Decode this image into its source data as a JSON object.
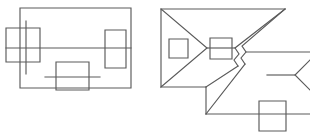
{
  "image": {
    "kind": "line-drawing",
    "description": "Two black-and-white geometric wireframe line drawings on a white background",
    "width": 310,
    "height": 133,
    "background_color": "#ffffff",
    "stroke_color": "#5a5a5a",
    "stroke_width": 1.15,
    "figure_count": 2
  },
  "figures": [
    {
      "id": "figure-left",
      "name": "rectangle-with-three-squares",
      "origin": {
        "x": 0,
        "y": 0
      },
      "shapes": [
        {
          "name": "outer-rectangle",
          "type": "polyline",
          "closed": true,
          "points": [
            [
              20,
              8
            ],
            [
              131,
              8
            ],
            [
              131,
              88
            ],
            [
              20,
              88
            ]
          ]
        },
        {
          "name": "horizontal-midline",
          "type": "polyline",
          "closed": false,
          "points": [
            [
              6,
              48
            ],
            [
              131,
              48
            ]
          ]
        },
        {
          "name": "left-vertical-line",
          "type": "polyline",
          "closed": false,
          "points": [
            [
              26,
              21
            ],
            [
              26,
              74
            ]
          ]
        },
        {
          "name": "left-square",
          "type": "rect",
          "x": 6,
          "y": 28,
          "width": 34,
          "height": 34
        },
        {
          "name": "right-square",
          "type": "rect",
          "x": 105,
          "y": 30,
          "width": 21,
          "height": 38
        },
        {
          "name": "bottom-square",
          "type": "rect",
          "x": 56,
          "y": 62,
          "width": 33,
          "height": 28
        },
        {
          "name": "bottom-square-midline",
          "type": "polyline",
          "closed": false,
          "points": [
            [
              45,
              77
            ],
            [
              100,
              77
            ]
          ]
        }
      ]
    },
    {
      "id": "figure-right",
      "name": "folded-polygon-with-three-squares",
      "origin": {
        "x": 155,
        "y": 0
      },
      "shapes": [
        {
          "name": "upper-body-outline",
          "type": "polyline",
          "closed": false,
          "points": [
            [
              6,
              9
            ],
            [
              52,
              48
            ],
            [
              6,
              87
            ],
            [
              6,
              9
            ]
          ]
        },
        {
          "name": "upper-top-edge",
          "type": "polyline",
          "closed": false,
          "points": [
            [
              6,
              9
            ],
            [
              130,
              9
            ]
          ]
        },
        {
          "name": "upper-right-fold",
          "type": "polyline",
          "closed": false,
          "points": [
            [
              130,
              9
            ],
            [
              87,
              46
            ],
            [
              91,
              52
            ],
            [
              86,
              58
            ],
            [
              90,
              64
            ]
          ]
        },
        {
          "name": "upper-diagonal-to-fold",
          "type": "polyline",
          "closed": false,
          "points": [
            [
              130,
              9
            ],
            [
              80,
              48
            ],
            [
              84,
              54
            ],
            [
              79,
              60
            ],
            [
              83,
              66
            ]
          ]
        },
        {
          "name": "mid-horizontal-left",
          "type": "polyline",
          "closed": false,
          "points": [
            [
              52,
              48
            ],
            [
              80,
              48
            ]
          ]
        },
        {
          "name": "mid-horizontal-right",
          "type": "polyline",
          "closed": false,
          "points": [
            [
              91,
              52
            ],
            [
              155,
              52
            ]
          ]
        },
        {
          "name": "lower-left-edge",
          "type": "polyline",
          "closed": false,
          "points": [
            [
              6,
              87
            ],
            [
              51,
              87
            ]
          ]
        },
        {
          "name": "lower-vertical",
          "type": "polyline",
          "closed": false,
          "points": [
            [
              51,
              87
            ],
            [
              51,
              114
            ]
          ]
        },
        {
          "name": "lower-diagonal-up",
          "type": "polyline",
          "closed": false,
          "points": [
            [
              51,
              87
            ],
            [
              83,
              66
            ]
          ]
        },
        {
          "name": "lower-diagonal-down",
          "type": "polyline",
          "closed": false,
          "points": [
            [
              51,
              114
            ],
            [
              90,
              64
            ]
          ]
        },
        {
          "name": "lower-bottom-edge",
          "type": "polyline",
          "closed": false,
          "points": [
            [
              51,
              114
            ],
            [
              155,
              114
            ]
          ]
        },
        {
          "name": "right-chevron",
          "type": "polyline",
          "closed": false,
          "points": [
            [
              155,
              60
            ],
            [
              140,
              75
            ],
            [
              155,
              90
            ]
          ]
        },
        {
          "name": "right-mid-horizontal",
          "type": "polyline",
          "closed": false,
          "points": [
            [
              112,
              75
            ],
            [
              140,
              75
            ]
          ]
        },
        {
          "name": "left-small-square",
          "type": "rect",
          "x": 14,
          "y": 39,
          "width": 19,
          "height": 19
        },
        {
          "name": "center-small-square",
          "type": "rect",
          "x": 55,
          "y": 38,
          "width": 22,
          "height": 21
        },
        {
          "name": "bottom-right-square",
          "type": "rect",
          "x": 104,
          "y": 101,
          "width": 27,
          "height": 30
        }
      ]
    }
  ]
}
